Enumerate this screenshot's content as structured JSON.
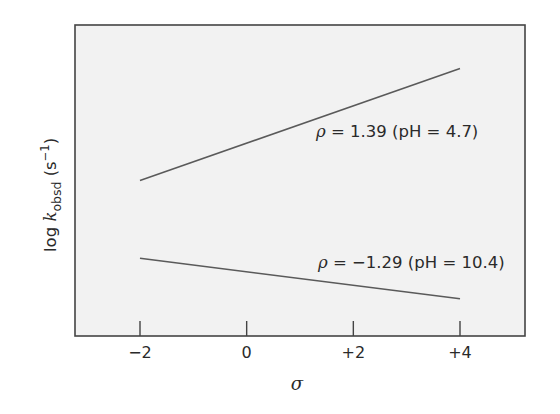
{
  "chart_data": {
    "type": "line",
    "title": "",
    "xlabel": "σ",
    "ylabel": "log k_obsd (s^-1)",
    "ylabel_parts": {
      "prefix": "log ",
      "k": "k",
      "subscript": "obsd",
      "unit_open": " (s",
      "unit_sup": "−1",
      "unit_close": ")"
    },
    "xlim": [
      -3.2,
      5.3
    ],
    "x_ticks": [
      -2,
      0,
      2,
      4
    ],
    "x_tick_labels": [
      "−2",
      "0",
      "+2",
      "+4"
    ],
    "y_ticks": [],
    "y_tick_labels": [],
    "grid": false,
    "legend": "none (inline annotations)",
    "series": [
      {
        "name": "pH = 4.7",
        "rho": 1.39,
        "pH": 4.7,
        "x": [
          -2,
          4
        ],
        "y_relative": [
          0.5,
          0.86
        ],
        "annotation": {
          "rho_symbol": "ρ",
          "text": " = 1.39 (pH = 4.7)"
        }
      },
      {
        "name": "pH = 10.4",
        "rho": -1.29,
        "pH": 10.4,
        "x": [
          -2,
          4
        ],
        "y_relative": [
          0.25,
          0.12
        ],
        "annotation": {
          "rho_symbol": "ρ",
          "text": " = −1.29 (pH = 10.4)"
        }
      }
    ]
  },
  "colors": {
    "plot_background": "#f2f2f2",
    "frame": "#444444",
    "line": "#5a5a5a",
    "text": "#2a2a2a"
  }
}
